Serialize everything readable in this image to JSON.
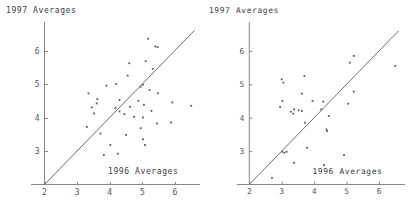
{
  "figure": {
    "title": "",
    "panel_count": 2
  },
  "chart_data": [
    {
      "id": "left",
      "type": "scatter",
      "title": "",
      "xlabel": "1996 Averages",
      "ylabel": "1997 Averages",
      "xlim": [
        2,
        6.6
      ],
      "ylim": [
        2,
        6.6
      ],
      "xticks": [
        2,
        3,
        4,
        5,
        6
      ],
      "yticks": [
        3,
        4,
        5,
        6
      ],
      "xtick_labels": [
        "2",
        "3",
        "4",
        "5",
        "6"
      ],
      "ytick_labels": [
        "3",
        "4",
        "5",
        "6"
      ],
      "grid": false,
      "legend": null,
      "annotations": [
        {
          "name": "identity-reference-line",
          "type": "line",
          "from": [
            2,
            2
          ],
          "to": [
            6.6,
            6.6
          ]
        }
      ],
      "points": [
        [
          5.18,
          6.35
        ],
        [
          5.4,
          6.12
        ],
        [
          5.47,
          6.1
        ],
        [
          5.1,
          5.68
        ],
        [
          4.6,
          5.62
        ],
        [
          5.32,
          5.45
        ],
        [
          4.55,
          5.25
        ],
        [
          3.9,
          4.95
        ],
        [
          4.2,
          5.0
        ],
        [
          5.02,
          4.98
        ],
        [
          4.95,
          4.92
        ],
        [
          5.22,
          4.82
        ],
        [
          5.48,
          4.72
        ],
        [
          3.35,
          4.72
        ],
        [
          3.62,
          4.55
        ],
        [
          4.3,
          4.52
        ],
        [
          4.88,
          4.5
        ],
        [
          3.6,
          4.42
        ],
        [
          3.45,
          4.3
        ],
        [
          4.18,
          4.28
        ],
        [
          4.62,
          4.32
        ],
        [
          5.05,
          4.38
        ],
        [
          5.92,
          4.45
        ],
        [
          6.5,
          4.35
        ],
        [
          4.3,
          4.18
        ],
        [
          5.28,
          4.2
        ],
        [
          4.45,
          4.1
        ],
        [
          3.52,
          4.12
        ],
        [
          4.75,
          4.02
        ],
        [
          5.02,
          4.0
        ],
        [
          5.45,
          3.82
        ],
        [
          5.88,
          3.85
        ],
        [
          3.3,
          3.72
        ],
        [
          4.95,
          3.68
        ],
        [
          3.72,
          3.52
        ],
        [
          4.5,
          3.48
        ],
        [
          4.02,
          3.18
        ],
        [
          5.02,
          3.35
        ],
        [
          5.08,
          3.18
        ],
        [
          4.25,
          2.92
        ],
        [
          3.82,
          2.88
        ]
      ]
    },
    {
      "id": "right",
      "type": "scatter",
      "title": "",
      "xlabel": "1996 Averages",
      "ylabel": "1997 Averages",
      "xlim": [
        2,
        6.6
      ],
      "ylim": [
        2,
        6.6
      ],
      "xticks": [
        2,
        3,
        4,
        5,
        6
      ],
      "yticks": [
        3,
        4,
        5,
        6
      ],
      "xtick_labels": [
        "2",
        "3",
        "4",
        "5",
        "6"
      ],
      "ytick_labels": [
        "3",
        "4",
        "5",
        "6"
      ],
      "grid": false,
      "legend": null,
      "annotations": [
        {
          "name": "identity-reference-line",
          "type": "line",
          "from": [
            2,
            2
          ],
          "to": [
            6.6,
            6.6
          ]
        }
      ],
      "points": [
        [
          5.22,
          5.85
        ],
        [
          5.1,
          5.65
        ],
        [
          6.5,
          5.55
        ],
        [
          3.7,
          5.25
        ],
        [
          3.0,
          5.15
        ],
        [
          3.05,
          5.05
        ],
        [
          5.22,
          4.78
        ],
        [
          3.62,
          4.72
        ],
        [
          3.02,
          4.5
        ],
        [
          3.95,
          4.5
        ],
        [
          4.28,
          4.48
        ],
        [
          5.05,
          4.42
        ],
        [
          2.95,
          4.32
        ],
        [
          3.38,
          4.25
        ],
        [
          3.52,
          4.22
        ],
        [
          3.62,
          4.2
        ],
        [
          4.22,
          4.25
        ],
        [
          3.28,
          4.18
        ],
        [
          3.35,
          4.12
        ],
        [
          4.45,
          4.05
        ],
        [
          3.72,
          3.85
        ],
        [
          4.38,
          3.65
        ],
        [
          4.4,
          3.6
        ],
        [
          3.78,
          3.1
        ],
        [
          3.02,
          2.98
        ],
        [
          3.15,
          2.98
        ],
        [
          3.08,
          2.95
        ],
        [
          4.92,
          2.88
        ],
        [
          4.3,
          2.58
        ],
        [
          3.38,
          2.65
        ],
        [
          2.7,
          2.2
        ]
      ]
    }
  ]
}
